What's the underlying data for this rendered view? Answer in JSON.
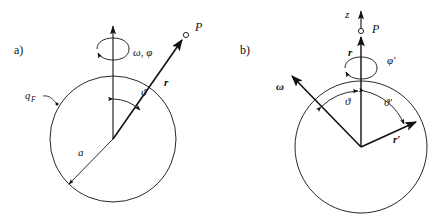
{
  "figure": {
    "width": 438,
    "height": 224,
    "background": "#ffffff",
    "ink_color": "#111111",
    "type": "physics-vector-diagram"
  },
  "panels": [
    {
      "id": "a",
      "tag": "a)",
      "tag_pos": {
        "x": 14,
        "y": 50
      },
      "circle": {
        "cx": 113,
        "cy": 139,
        "r": 63
      },
      "axis": {
        "x": 113,
        "y_top": 22,
        "y_bottom": 139,
        "arrow": "up"
      },
      "labels": {
        "surface": "q",
        "surface_sub": "F",
        "rotation": "ω, φ",
        "point": "P",
        "radius_vector": "r",
        "polar_angle": "ϑ",
        "sphere_radius": "a"
      }
    },
    {
      "id": "b",
      "tag": "b)",
      "tag_pos": {
        "x": 240,
        "y": 50
      },
      "circle": {
        "cx": 361,
        "cy": 147,
        "r": 66
      },
      "axis": {
        "x": 361,
        "y_top": 8,
        "y_bottom": 147,
        "arrow": "up"
      },
      "labels": {
        "z_axis": "z",
        "point": "P",
        "radius_vector": "r",
        "rotation": "φ′",
        "omega_vector": "ω",
        "polar_angle": "ϑ",
        "polar_angle_prime": "ϑ′",
        "radius_vector_prime": "r′"
      }
    }
  ],
  "a_labels": {
    "tag": "a)",
    "q_main": "q",
    "q_sub": "F",
    "omega_phi": "ω, φ",
    "P": "P",
    "r": "r",
    "theta": "ϑ",
    "a": "a"
  },
  "b_labels": {
    "tag": "b)",
    "z": "z",
    "P": "P",
    "r": "r",
    "phi_prime": "φ′",
    "omega": "ω",
    "theta": "ϑ",
    "theta_prime": "ϑ′",
    "r_prime": "r′"
  }
}
